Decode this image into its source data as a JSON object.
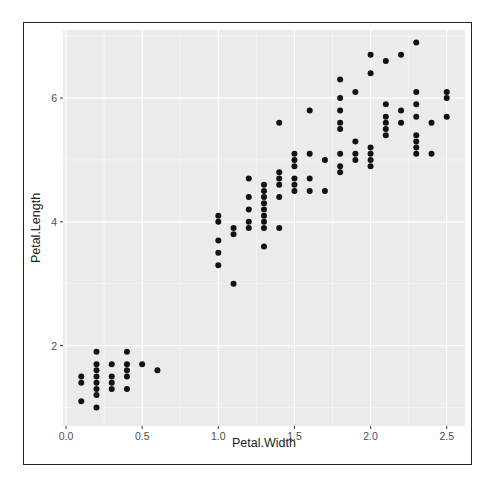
{
  "chart_data": {
    "type": "scatter",
    "title": "",
    "xlabel": "Petal.Width",
    "ylabel": "Petal.Length",
    "xlim": [
      -0.02,
      2.62
    ],
    "ylim": [
      0.7,
      7.1
    ],
    "x_ticks": [
      0.0,
      0.5,
      1.0,
      1.5,
      2.0,
      2.5
    ],
    "x_tick_labels": [
      "0.0",
      "0.5",
      "1.0",
      "1.5",
      "2.0",
      "2.5"
    ],
    "y_ticks": [
      2,
      4,
      6
    ],
    "y_tick_labels": [
      "2",
      "4",
      "6"
    ],
    "grid": true,
    "legend": "none",
    "point_color": "#111111",
    "panel_background": "#ebebeb",
    "grid_color": "#ffffff",
    "points": [
      [
        0.1,
        1.5
      ],
      [
        0.1,
        1.4
      ],
      [
        0.1,
        1.1
      ],
      [
        0.2,
        1.9
      ],
      [
        0.2,
        1.7
      ],
      [
        0.2,
        1.6
      ],
      [
        0.2,
        1.5
      ],
      [
        0.2,
        1.4
      ],
      [
        0.2,
        1.3
      ],
      [
        0.2,
        1.2
      ],
      [
        0.2,
        1.0
      ],
      [
        0.3,
        1.7
      ],
      [
        0.3,
        1.5
      ],
      [
        0.3,
        1.4
      ],
      [
        0.3,
        1.3
      ],
      [
        0.4,
        1.9
      ],
      [
        0.4,
        1.7
      ],
      [
        0.4,
        1.6
      ],
      [
        0.4,
        1.5
      ],
      [
        0.4,
        1.3
      ],
      [
        0.5,
        1.7
      ],
      [
        0.6,
        1.6
      ],
      [
        1.0,
        4.1
      ],
      [
        1.0,
        4.0
      ],
      [
        1.0,
        3.7
      ],
      [
        1.0,
        3.5
      ],
      [
        1.0,
        3.3
      ],
      [
        1.1,
        3.9
      ],
      [
        1.1,
        3.8
      ],
      [
        1.1,
        3.0
      ],
      [
        1.2,
        4.7
      ],
      [
        1.2,
        4.4
      ],
      [
        1.2,
        4.2
      ],
      [
        1.2,
        4.0
      ],
      [
        1.2,
        3.9
      ],
      [
        1.3,
        4.6
      ],
      [
        1.3,
        4.5
      ],
      [
        1.3,
        4.4
      ],
      [
        1.3,
        4.3
      ],
      [
        1.3,
        4.2
      ],
      [
        1.3,
        4.1
      ],
      [
        1.3,
        4.0
      ],
      [
        1.3,
        3.9
      ],
      [
        1.3,
        3.6
      ],
      [
        1.4,
        5.6
      ],
      [
        1.4,
        4.8
      ],
      [
        1.4,
        4.7
      ],
      [
        1.4,
        4.6
      ],
      [
        1.4,
        4.4
      ],
      [
        1.4,
        3.9
      ],
      [
        1.5,
        5.1
      ],
      [
        1.5,
        5.0
      ],
      [
        1.5,
        4.9
      ],
      [
        1.5,
        4.7
      ],
      [
        1.5,
        4.6
      ],
      [
        1.5,
        4.5
      ],
      [
        1.6,
        5.8
      ],
      [
        1.6,
        5.1
      ],
      [
        1.6,
        4.7
      ],
      [
        1.6,
        4.5
      ],
      [
        1.7,
        5.0
      ],
      [
        1.7,
        4.5
      ],
      [
        1.8,
        6.3
      ],
      [
        1.8,
        6.0
      ],
      [
        1.8,
        5.8
      ],
      [
        1.8,
        5.6
      ],
      [
        1.8,
        5.5
      ],
      [
        1.8,
        5.1
      ],
      [
        1.8,
        4.9
      ],
      [
        1.8,
        4.8
      ],
      [
        1.9,
        6.1
      ],
      [
        1.9,
        5.3
      ],
      [
        1.9,
        5.1
      ],
      [
        1.9,
        5.0
      ],
      [
        2.0,
        6.7
      ],
      [
        2.0,
        6.4
      ],
      [
        2.0,
        5.2
      ],
      [
        2.0,
        5.1
      ],
      [
        2.0,
        5.0
      ],
      [
        2.0,
        4.9
      ],
      [
        2.1,
        6.6
      ],
      [
        2.1,
        5.9
      ],
      [
        2.1,
        5.7
      ],
      [
        2.1,
        5.6
      ],
      [
        2.1,
        5.5
      ],
      [
        2.1,
        5.4
      ],
      [
        2.2,
        6.7
      ],
      [
        2.2,
        5.8
      ],
      [
        2.2,
        5.6
      ],
      [
        2.3,
        6.9
      ],
      [
        2.3,
        6.1
      ],
      [
        2.3,
        5.9
      ],
      [
        2.3,
        5.7
      ],
      [
        2.3,
        5.4
      ],
      [
        2.3,
        5.3
      ],
      [
        2.3,
        5.2
      ],
      [
        2.3,
        5.1
      ],
      [
        2.4,
        5.6
      ],
      [
        2.4,
        5.1
      ],
      [
        2.5,
        6.1
      ],
      [
        2.5,
        6.0
      ],
      [
        2.5,
        5.7
      ]
    ]
  }
}
